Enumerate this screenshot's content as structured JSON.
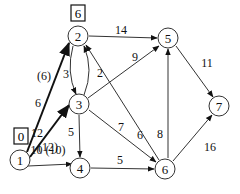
{
  "nodes": [
    {
      "id": "1",
      "label": "1",
      "x": 20,
      "y": 160
    },
    {
      "id": "2",
      "label": "2",
      "x": 78,
      "y": 36
    },
    {
      "id": "3",
      "label": "3",
      "x": 79,
      "y": 104
    },
    {
      "id": "4",
      "label": "4",
      "x": 80,
      "y": 168
    },
    {
      "id": "5",
      "label": "5",
      "x": 168,
      "y": 38
    },
    {
      "id": "6",
      "label": "6",
      "x": 165,
      "y": 169
    },
    {
      "id": "7",
      "label": "7",
      "x": 219,
      "y": 106
    }
  ],
  "labels_box": [
    {
      "node": "1",
      "value": "0"
    },
    {
      "node": "2",
      "value": "6"
    }
  ],
  "edges": [
    {
      "from": "1",
      "to": "2",
      "weight": "6",
      "flow": "(6)",
      "bold": true
    },
    {
      "from": "1",
      "to": "3",
      "weight": "10",
      "flow": "(10)",
      "bold": true
    },
    {
      "from": "1",
      "to": "4",
      "weight": "12",
      "flow": "(12)",
      "bold": true
    },
    {
      "from": "2",
      "to": "3",
      "weight": "3"
    },
    {
      "from": "3",
      "to": "2",
      "weight": "2"
    },
    {
      "from": "2",
      "to": "5",
      "weight": "14"
    },
    {
      "from": "3",
      "to": "5",
      "weight": "9"
    },
    {
      "from": "6",
      "to": "2",
      "weight": "6"
    },
    {
      "from": "3",
      "to": "6",
      "weight": "7"
    },
    {
      "from": "3",
      "to": "4",
      "weight": "5"
    },
    {
      "from": "4",
      "to": "6",
      "weight": "5"
    },
    {
      "from": "6",
      "to": "5",
      "weight": "8"
    },
    {
      "from": "5",
      "to": "7",
      "weight": "11"
    },
    {
      "from": "6",
      "to": "7",
      "weight": "16"
    }
  ],
  "text": {
    "n1": "1",
    "n2": "2",
    "n3": "3",
    "n4": "4",
    "n5": "5",
    "n6": "6",
    "n7": "7",
    "box1": "0",
    "box2": "6",
    "w12": "6",
    "f12": "(6)",
    "w13": "10 (10)",
    "w14": "12",
    "f14": "(12)",
    "w23": "3",
    "w32": "2",
    "w25": "14",
    "w35": "9",
    "w62": "6",
    "w36": "7",
    "w34": "5",
    "w46": "5",
    "w65": "8",
    "w57": "11",
    "w67": "16"
  }
}
